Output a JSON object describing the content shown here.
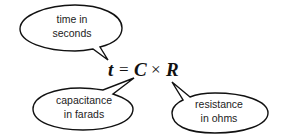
{
  "equation": {
    "lhs": "t",
    "equals": "=",
    "term1": "C",
    "times": "×",
    "term2": "R"
  },
  "callouts": [
    {
      "id": "time",
      "line1": "time in",
      "line2": "seconds",
      "points_to": "t"
    },
    {
      "id": "capacitance",
      "line1": "capacitance",
      "line2": "in farads",
      "points_to": "C"
    },
    {
      "id": "resistance",
      "line1": "resistance",
      "line2": "in ohms",
      "points_to": "R"
    }
  ]
}
